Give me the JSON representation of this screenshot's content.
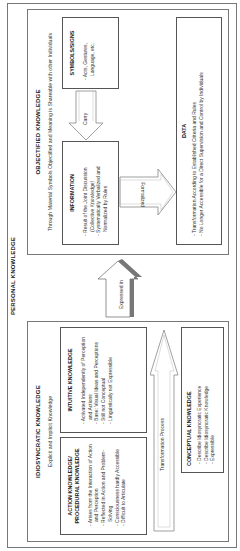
{
  "title": "PERSONAL KNOWLEDGE",
  "idiosyncratic": {
    "title": "IDIOSYNCRATIC KNOWLEDGE",
    "subtitle": "Explicit and Implicit Knowledge",
    "action": {
      "title": "ACTION KNOWLEDGE/ PROCEDURAL KNOWLEDGE",
      "items": [
        "Arises from the Interaction of Action and Perception",
        "Reflected in Action and Problem-Solving",
        "Consciousness hardly Accessible",
        "Difficult to Articulate"
      ]
    },
    "intuitive": {
      "title": "INTUITIVE KNOWLEDGE",
      "items": [
        "Activated Independently of Perception and Actions",
        "Base: Visual Ideas and Perceptions",
        "Still not Conceptual",
        "Linguistically not Expressible"
      ]
    },
    "transformation_label": "Transformation Process",
    "conceptual": {
      "title": "CONCEPTUAL KNOWLEDGE",
      "items": [
        "Describe Idiosyncratic Experience",
        "Describe Idiosyncratic Knowledge",
        "Expressible"
      ]
    }
  },
  "expressed_label": "Expressed in",
  "objectified": {
    "title": "OBJECTIFIED KNOWLEDGE",
    "subtitle": "Through Material Symbols Objectified and Meaning is Shareable with other Individuals",
    "information": {
      "title": "INFORMATION",
      "items": [
        "Result of the Joint Discussion (Collective Knowledge)",
        "Systematically Verbalized and Normalized by Rules"
      ]
    },
    "carry_label": "Carry",
    "symbols": {
      "title": "SYMBOLS/SIGNS",
      "items": [
        "Acts, Gestures, Language, etc."
      ]
    },
    "formalized_label": "Formalized",
    "data": {
      "title": "DATA",
      "items": [
        "Transformation According to Established Criteria and Rules",
        "No Longer Accessible for a Direct Supervision and Control by Individuals"
      ]
    }
  }
}
